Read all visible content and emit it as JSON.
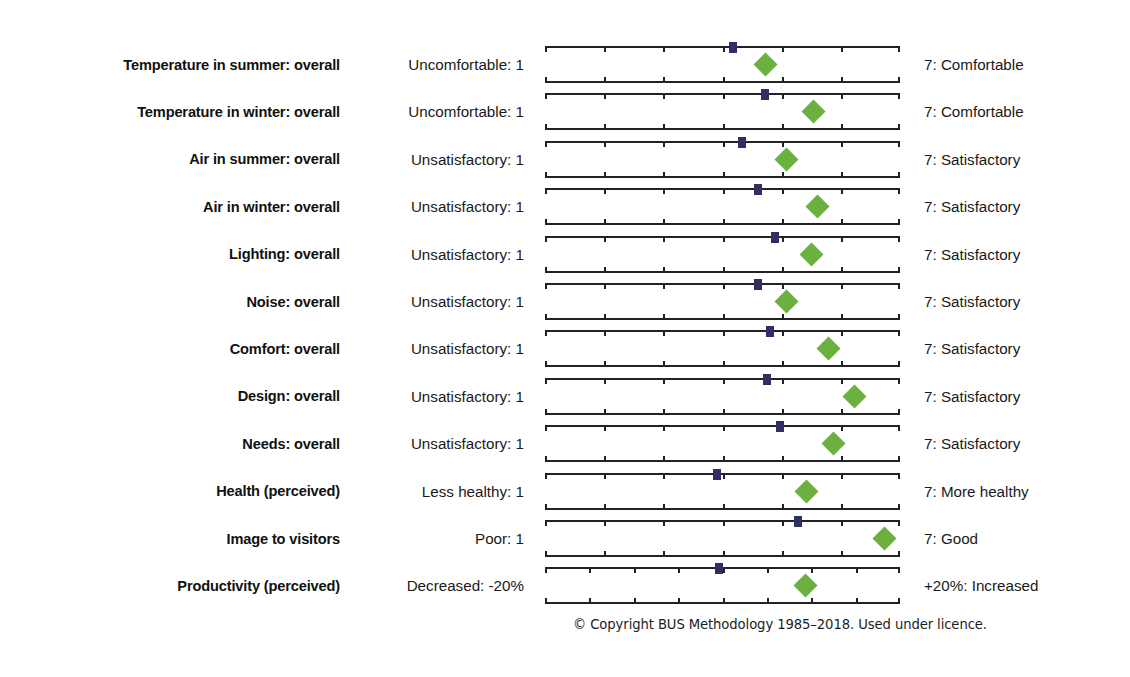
{
  "figure": {
    "footer_note": "© Copyright BUS Methodology 1985–2018. Used under licence.",
    "marker_colors": {
      "benchmark_square": "#2f2f63",
      "score_diamond": "#6cb13f"
    }
  },
  "chart_data": {
    "type": "scatter",
    "title": "",
    "xlabel": "",
    "ylabel": "",
    "grid": false,
    "legend_position": "none",
    "orientation": "horizontal-scales",
    "default_scale": {
      "min": 1,
      "max": 7,
      "ticks": [
        1,
        2,
        3,
        4,
        5,
        6,
        7
      ]
    },
    "series": [
      {
        "name": "Benchmark (scale mid/benchmark mean)",
        "marker": "square",
        "color": "#2f2f63"
      },
      {
        "name": "Building score",
        "marker": "diamond",
        "color": "#6cb13f"
      }
    ],
    "categories": [
      "Temperature in summer: overall",
      "Temperature in winter: overall",
      "Air in summer: overall",
      "Air in winter: overall",
      "Lighting: overall",
      "Noise: overall",
      "Comfort: overall",
      "Design: overall",
      "Needs: overall",
      "Health (perceived)",
      "Image to visitors",
      "Productivity (perceived)"
    ],
    "rows": [
      {
        "label": "Temperature in summer: overall",
        "left_anchor": "Uncomfortable: 1",
        "right_anchor": "7: Comfortable",
        "scale_min": 1,
        "scale_max": 7,
        "tick_count": 7,
        "benchmark": 4.17,
        "score": 4.72
      },
      {
        "label": "Temperature in winter: overall",
        "left_anchor": "Uncomfortable: 1",
        "right_anchor": "7: Comfortable",
        "scale_min": 1,
        "scale_max": 7,
        "tick_count": 7,
        "benchmark": 4.72,
        "score": 5.54
      },
      {
        "label": "Air in summer: overall",
        "left_anchor": "Unsatisfactory: 1",
        "right_anchor": "7: Satisfactory",
        "scale_min": 1,
        "scale_max": 7,
        "tick_count": 7,
        "benchmark": 4.33,
        "score": 5.08
      },
      {
        "label": "Air in winter: overall",
        "left_anchor": "Unsatisfactory: 1",
        "right_anchor": "7: Satisfactory",
        "scale_min": 1,
        "scale_max": 7,
        "tick_count": 7,
        "benchmark": 4.6,
        "score": 5.6
      },
      {
        "label": "Lighting: overall",
        "left_anchor": "Unsatisfactory: 1",
        "right_anchor": "7: Satisfactory",
        "scale_min": 1,
        "scale_max": 7,
        "tick_count": 7,
        "benchmark": 4.89,
        "score": 5.51
      },
      {
        "label": "Noise: overall",
        "left_anchor": "Unsatisfactory: 1",
        "right_anchor": "7: Satisfactory",
        "scale_min": 1,
        "scale_max": 7,
        "tick_count": 7,
        "benchmark": 4.6,
        "score": 5.08
      },
      {
        "label": "Comfort: overall",
        "left_anchor": "Unsatisfactory: 1",
        "right_anchor": "7: Satisfactory",
        "scale_min": 1,
        "scale_max": 7,
        "tick_count": 7,
        "benchmark": 4.8,
        "score": 5.79
      },
      {
        "label": "Design: overall",
        "left_anchor": "Unsatisfactory: 1",
        "right_anchor": "7: Satisfactory",
        "scale_min": 1,
        "scale_max": 7,
        "tick_count": 7,
        "benchmark": 4.76,
        "score": 6.23
      },
      {
        "label": "Needs: overall",
        "left_anchor": "Unsatisfactory: 1",
        "right_anchor": "7: Satisfactory",
        "scale_min": 1,
        "scale_max": 7,
        "tick_count": 7,
        "benchmark": 4.97,
        "score": 5.88
      },
      {
        "label": "Health (perceived)",
        "left_anchor": "Less healthy: 1",
        "right_anchor": "7: More healthy",
        "scale_min": 1,
        "scale_max": 7,
        "tick_count": 7,
        "benchmark": 3.9,
        "score": 5.42
      },
      {
        "label": "Image to visitors",
        "left_anchor": "Poor: 1",
        "right_anchor": "7: Good",
        "scale_min": 1,
        "scale_max": 7,
        "tick_count": 7,
        "benchmark": 5.28,
        "score": 6.74
      },
      {
        "label": "Productivity (perceived)",
        "left_anchor": "Decreased: -20%",
        "right_anchor": "+20%: Increased",
        "scale_min": -20,
        "scale_max": 20,
        "tick_count": 9,
        "benchmark": -0.4,
        "score": 9.3
      }
    ]
  }
}
